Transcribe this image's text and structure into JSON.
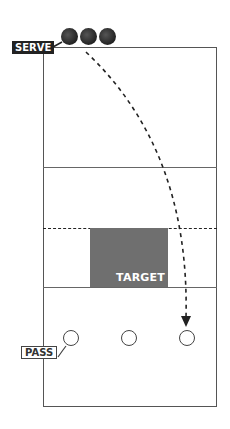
{
  "diagram": {
    "type": "volleyball serve-receive drill",
    "labels": {
      "serve": "SERVE",
      "pass": "PASS",
      "target": "TARGET"
    },
    "colors": {
      "court_line": "#555555",
      "target_fill": "#6f6f6f",
      "ball": "#222222",
      "serve_tag_bg": "#222222",
      "path": "#222222"
    },
    "balls": [
      {
        "name": "ball-1"
      },
      {
        "name": "ball-2"
      },
      {
        "name": "ball-3"
      }
    ],
    "passers": [
      {
        "name": "passer-left"
      },
      {
        "name": "passer-middle"
      },
      {
        "name": "passer-right"
      }
    ],
    "path": {
      "style": "dashed",
      "from": "serve",
      "to": "passer-right",
      "arrow": true
    }
  }
}
